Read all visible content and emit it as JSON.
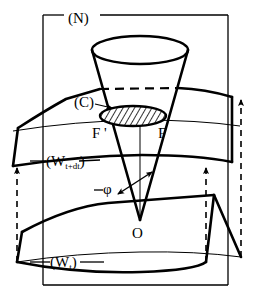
{
  "figure": {
    "kind": "geometric-diagram",
    "background_color": "#ffffff",
    "line_color": "#000000"
  },
  "labels": {
    "frame": "(N)",
    "ellipse_curve": "(C)",
    "point_left": "F '",
    "point_right": "F",
    "surface_upper_open": "(W",
    "surface_upper_sub": "t+dt",
    "surface_upper_close": ")",
    "angle": "φ",
    "apex": "O",
    "surface_lower_open": "(W",
    "surface_lower_sub": "t",
    "surface_lower_close": ")"
  },
  "geometry": {
    "frame_rect": {
      "x": 43,
      "y": 15,
      "width": 185,
      "height": 270
    },
    "frame_gap": {
      "x1": 64,
      "x2": 100
    },
    "cone": {
      "apex": {
        "x": 140,
        "y": 220
      },
      "top_ellipse": {
        "cx": 140,
        "cy": 50,
        "rx": 48,
        "ry": 14
      },
      "cut_ellipse": {
        "cx": 133,
        "cy": 116,
        "rx": 33,
        "ry": 10
      }
    },
    "hatching": {
      "angle_deg": 30,
      "spacing_px": 5
    }
  }
}
